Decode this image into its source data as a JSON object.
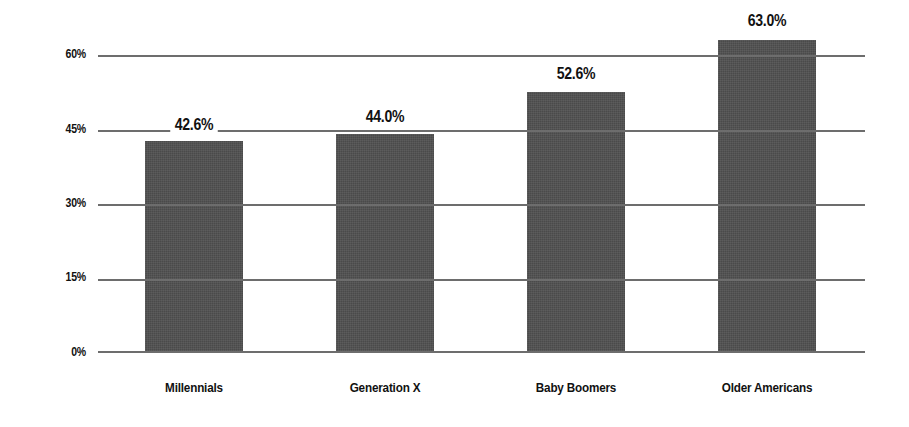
{
  "chart_data": {
    "type": "bar",
    "title": "",
    "subtitle": "",
    "xlabel": "",
    "ylabel": "",
    "categories": [
      "Millennials",
      "Generation X",
      "Baby Boomers",
      "Older Americans"
    ],
    "values": [
      42.6,
      44.0,
      52.6,
      63.0
    ],
    "data_labels": [
      "42.6%",
      "44.0%",
      "52.6%",
      "63.0%"
    ],
    "ylim": [
      0,
      63
    ],
    "yticks": [
      0,
      15,
      30,
      45,
      60
    ],
    "ytick_labels": [
      "0%",
      "15%",
      "30%",
      "45%",
      "60%"
    ],
    "grid": true,
    "legend": "none",
    "bar_color": "#4a4a4a",
    "gridline_color": "#6d6d6d",
    "text_color": "#111111",
    "background_color": "#ffffff"
  }
}
